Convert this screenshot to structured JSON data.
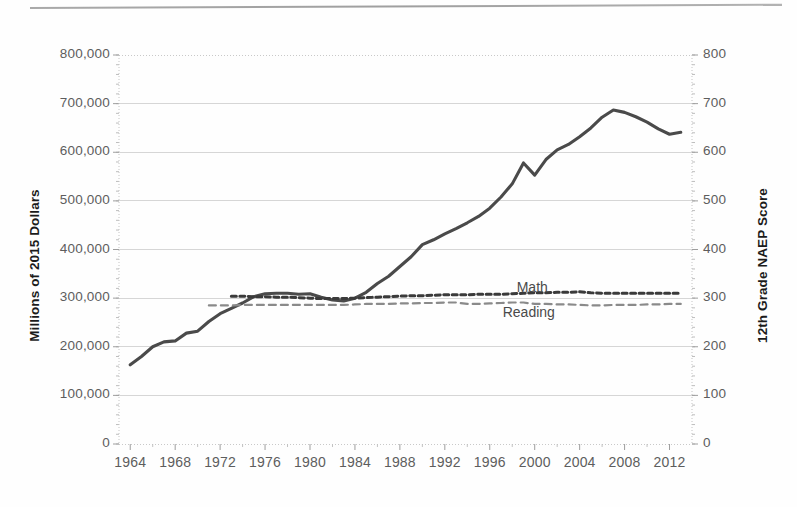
{
  "chart_data": {
    "type": "line",
    "title": "",
    "subtitle": "",
    "xlabel": "",
    "ylabel": "Millions of 2015 Dollars",
    "y2label": "12th Grade NAEP Score",
    "grid": true,
    "legend_position": "inline-annotation",
    "xlim": [
      1963,
      2014
    ],
    "ylim": [
      0,
      800000
    ],
    "y2lim": [
      0,
      800
    ],
    "x_ticks": [
      "1964",
      "1968",
      "1972",
      "1976",
      "1980",
      "1984",
      "1988",
      "1992",
      "1996",
      "2000",
      "2004",
      "2008",
      "2012"
    ],
    "y_ticks": [
      "0",
      "100,000",
      "200,000",
      "300,000",
      "400,000",
      "500,000",
      "600,000",
      "700,000",
      "800,000"
    ],
    "y2_ticks": [
      "0",
      "100",
      "200",
      "300",
      "400",
      "500",
      "600",
      "700",
      "800"
    ],
    "series": [
      {
        "name": "Total Spending",
        "style": "solid",
        "color": "#4a4a4a",
        "axis": "left",
        "x": [
          1964,
          1965,
          1966,
          1967,
          1968,
          1969,
          1970,
          1971,
          1972,
          1973,
          1974,
          1975,
          1976,
          1977,
          1978,
          1979,
          1980,
          1981,
          1982,
          1983,
          1984,
          1985,
          1986,
          1987,
          1988,
          1989,
          1990,
          1991,
          1992,
          1993,
          1994,
          1995,
          1996,
          1997,
          1998,
          1999,
          2000,
          2001,
          2002,
          2003,
          2004,
          2005,
          2006,
          2007,
          2008,
          2009,
          2010,
          2011,
          2012,
          2013
        ],
        "values": [
          163000,
          180000,
          200000,
          210000,
          212000,
          228000,
          232000,
          252000,
          268000,
          279000,
          290000,
          303000,
          309000,
          310000,
          310000,
          308000,
          309000,
          302000,
          296000,
          294000,
          300000,
          312000,
          330000,
          345000,
          365000,
          385000,
          410000,
          420000,
          432000,
          443000,
          455000,
          468000,
          485000,
          508000,
          535000,
          578000,
          553000,
          585000,
          605000,
          616000,
          632000,
          650000,
          672000,
          687000,
          682000,
          673000,
          662000,
          648000,
          637000,
          641000
        ]
      },
      {
        "name": "Math",
        "style": "dashed-dense",
        "color": "#3a3a3a",
        "axis": "right",
        "x": [
          1973,
          1974,
          1975,
          1976,
          1977,
          1978,
          1979,
          1980,
          1981,
          1982,
          1983,
          1984,
          1985,
          1986,
          1987,
          1988,
          1989,
          1990,
          1991,
          1992,
          1993,
          1994,
          1995,
          1996,
          1997,
          1998,
          1999,
          2000,
          2001,
          2002,
          2003,
          2004,
          2005,
          2006,
          2007,
          2008,
          2009,
          2010,
          2011,
          2012,
          2013
        ],
        "values": [
          304,
          304,
          303,
          303,
          302,
          302,
          301,
          300,
          299,
          299,
          299,
          300,
          301,
          302,
          303,
          304,
          305,
          305,
          306,
          307,
          307,
          307,
          308,
          308,
          308,
          309,
          310,
          311,
          311,
          312,
          312,
          313,
          311,
          310,
          310,
          310,
          310,
          310,
          310,
          310,
          310
        ]
      },
      {
        "name": "Reading",
        "style": "dashed-long",
        "color": "#8a8a8a",
        "axis": "right",
        "x": [
          1971,
          1972,
          1973,
          1974,
          1975,
          1976,
          1977,
          1978,
          1979,
          1980,
          1981,
          1982,
          1983,
          1984,
          1985,
          1986,
          1987,
          1988,
          1989,
          1990,
          1991,
          1992,
          1993,
          1994,
          1995,
          1996,
          1997,
          1998,
          1999,
          2000,
          2001,
          2002,
          2003,
          2004,
          2005,
          2006,
          2007,
          2008,
          2009,
          2010,
          2011,
          2012,
          2013
        ],
        "values": [
          285,
          285,
          285,
          286,
          286,
          286,
          286,
          286,
          286,
          286,
          286,
          286,
          286,
          287,
          288,
          288,
          288,
          289,
          289,
          290,
          290,
          291,
          291,
          288,
          288,
          289,
          290,
          291,
          291,
          288,
          288,
          287,
          287,
          286,
          285,
          285,
          286,
          286,
          286,
          287,
          287,
          288,
          288
        ]
      }
    ],
    "annotations": [
      {
        "label": "Math",
        "x": 2000,
        "y": 320
      },
      {
        "label": "Reading",
        "x": 2000,
        "y": 270
      }
    ]
  },
  "axes": {
    "left_title": "Millions of 2015 Dollars",
    "right_title": "12th Grade NAEP Score",
    "left_ticks": [
      "800,000",
      "700,000",
      "600,000",
      "500,000",
      "400,000",
      "300,000",
      "200,000",
      "100,000",
      "0"
    ],
    "right_ticks": [
      "800",
      "700",
      "600",
      "500",
      "400",
      "300",
      "200",
      "100",
      "0"
    ],
    "x_ticks": [
      "1964",
      "1968",
      "1972",
      "1976",
      "1980",
      "1984",
      "1988",
      "1992",
      "1996",
      "2000",
      "2004",
      "2008",
      "2012"
    ]
  },
  "annotations": {
    "math_label": "Math",
    "reading_label": "Reading"
  },
  "colors": {
    "spending_line": "#4a4a4a",
    "math_line": "#3a3a3a",
    "reading_line": "#8a8a8a",
    "grid": "#d6d6d6",
    "tick_text": "#5d5d5d",
    "title_text": "#1b1b1b"
  }
}
